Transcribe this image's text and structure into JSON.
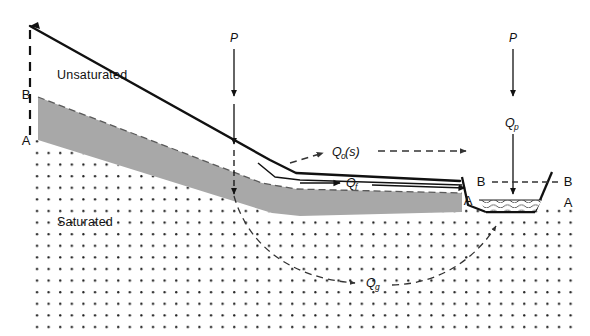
{
  "figure": {
    "width": 590,
    "height": 336,
    "background": "#ffffff"
  },
  "colors": {
    "line": "#111111",
    "soil_band_fill": "#a8a8a8",
    "saturated_dots": "#1a1a1a",
    "dashed_line": "#333333",
    "water_wave": "#444444",
    "background": "#ffffff"
  },
  "zones": [
    {
      "id": "unsaturated",
      "label": "Unsaturated",
      "x": 57,
      "y": 79
    },
    {
      "id": "saturated",
      "label": "Saturated",
      "x": 57,
      "y": 226
    }
  ],
  "horizon_markers": [
    {
      "id": "b-left",
      "label": "B",
      "x": 26,
      "y": 99
    },
    {
      "id": "a-left",
      "label": "A",
      "x": 26,
      "y": 145
    },
    {
      "id": "a-right-bank",
      "label": "A",
      "x": 468,
      "y": 205
    },
    {
      "id": "b-left-channel",
      "label": "B",
      "x": 481,
      "y": 184
    },
    {
      "id": "b-right-channel",
      "label": "B",
      "x": 566,
      "y": 184
    },
    {
      "id": "a-right-channel",
      "label": "A",
      "x": 566,
      "y": 205
    }
  ],
  "precipitation": [
    {
      "id": "p-hillslope",
      "label": "P",
      "x": 234,
      "y": 39
    },
    {
      "id": "p-channel",
      "label": "P",
      "x": 513,
      "y": 39
    }
  ],
  "fluxes": [
    {
      "id": "qos",
      "base": "Q",
      "sub": "o",
      "suffix": "(s)",
      "full_label": "Qo(s)",
      "description": "saturation overland flow",
      "x": 340,
      "y": 153
    },
    {
      "id": "qf",
      "base": "Q",
      "sub": "f",
      "suffix": "",
      "full_label": "Qf",
      "description": "subsurface stormflow / throughflow",
      "x": 352,
      "y": 183
    },
    {
      "id": "qp",
      "base": "Q",
      "sub": "p",
      "suffix": "",
      "full_label": "Qp",
      "description": "direct precipitation onto channel",
      "x": 506,
      "y": 124
    },
    {
      "id": "qg",
      "base": "Q",
      "sub": "g",
      "suffix": "",
      "full_label": "Qg",
      "description": "groundwater flow",
      "x": 375,
      "y": 283
    }
  ],
  "geometry": {
    "ground_surface": "M 30,26 L 270,160 L 296,173 L 460,181 L 468,205",
    "soil_band_top": "M 38,97 L 262,183 L 296,189 L 462,193",
    "soil_band_bottom": "M 38,140 L 272,213 L 300,216 L 462,212",
    "channel_left_bank": "M 468,176 L 486,212",
    "channel_bottom": "M 486,212 L 535,212",
    "channel_right_bank": "M 535,212 L 552,174",
    "water_surface_y": 200
  },
  "legend_note": {
    "visible": false
  }
}
